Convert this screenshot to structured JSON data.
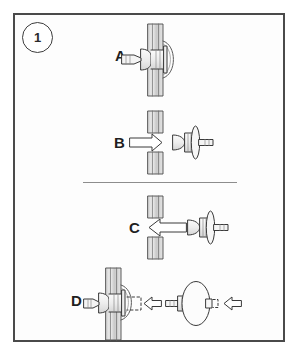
{
  "figure": {
    "kind": "instruction-diagram",
    "title_badge": "1",
    "border_color": "#4a4a4a",
    "line_color": "#3a3a3a",
    "panel_fill": "#d9d9d9",
    "background": "#ffffff"
  },
  "steps": [
    {
      "id": "A",
      "label": "A",
      "caption": "Rivet seated through panel, mandrel protruding",
      "has_arrow": false,
      "arrow_direction": "none",
      "panel_gap": false
    },
    {
      "id": "B",
      "label": "B",
      "caption": "Insert rivet into hole, push right",
      "has_arrow": true,
      "arrow_direction": "right",
      "panel_gap": true
    },
    {
      "id": "C",
      "label": "C",
      "caption": "Withdraw rivet from hole, pull left",
      "has_arrow": true,
      "arrow_direction": "left",
      "panel_gap": true
    },
    {
      "id": "D",
      "label": "D",
      "caption": "Align replacement rivet and press home",
      "has_arrow": true,
      "arrow_direction": "left",
      "panel_gap": false,
      "dashed_guide": true,
      "second_arrow_direction": "left"
    }
  ],
  "divider": {
    "present": true,
    "color": "#8d8d8d"
  }
}
